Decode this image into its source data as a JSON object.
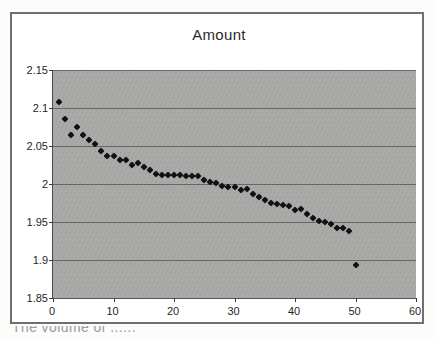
{
  "chart_data": {
    "type": "scatter",
    "title": "Amount",
    "xlabel": "",
    "ylabel": "",
    "grid": true,
    "legend": false,
    "xlim": [
      0,
      60
    ],
    "ylim": [
      1.85,
      2.15
    ],
    "xticks": [
      "0",
      "10",
      "20",
      "30",
      "40",
      "50",
      "60"
    ],
    "xtick_values": [
      0,
      10,
      20,
      30,
      40,
      50,
      60
    ],
    "yticks": [
      "1.85",
      "1.9",
      "1.95",
      "2",
      "2.05",
      "2.1",
      "2.15"
    ],
    "ytick_values": [
      1.85,
      1.9,
      1.95,
      2.0,
      2.05,
      2.1,
      2.15
    ],
    "marker": "diamond",
    "marker_color": "#111111",
    "plot_background": "#a9a9a7",
    "x": [
      1,
      2,
      3,
      4,
      5,
      6,
      7,
      8,
      9,
      10,
      11,
      12,
      13,
      14,
      15,
      16,
      17,
      18,
      19,
      20,
      21,
      22,
      23,
      24,
      25,
      26,
      27,
      28,
      29,
      30,
      31,
      32,
      33,
      34,
      35,
      36,
      37,
      38,
      39,
      40,
      41,
      42,
      43,
      44,
      45,
      46,
      47,
      48,
      49,
      50
    ],
    "y": [
      2.108,
      2.085,
      2.065,
      2.075,
      2.065,
      2.058,
      2.052,
      2.044,
      2.037,
      2.037,
      2.031,
      2.031,
      2.025,
      2.028,
      2.022,
      2.018,
      2.013,
      2.012,
      2.012,
      2.012,
      2.012,
      2.011,
      2.011,
      2.011,
      2.005,
      2.003,
      2.001,
      1.997,
      1.996,
      1.996,
      1.992,
      1.994,
      1.987,
      1.983,
      1.979,
      1.975,
      1.974,
      1.972,
      1.971,
      1.966,
      1.967,
      1.961,
      1.955,
      1.951,
      1.95,
      1.947,
      1.942,
      1.942,
      1.938,
      1.894
    ],
    "series_name": "Amount"
  },
  "caption": {
    "partial_text": "The volume of ......"
  }
}
